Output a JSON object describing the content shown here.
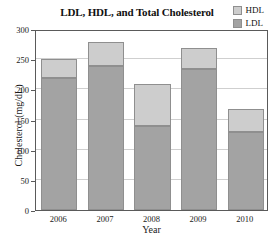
{
  "chart_data": {
    "type": "bar",
    "subtype": "stacked-bar",
    "title": "LDL, HDL, and Total Cholesterol",
    "xlabel": "Year",
    "ylabel": "Cholesterol (mg/dL)",
    "categories": [
      "2006",
      "2007",
      "2008",
      "2009",
      "2010"
    ],
    "series": [
      {
        "name": "LDL",
        "values": [
          219,
          239,
          139,
          234,
          129
        ],
        "color": "#a3a3a3"
      },
      {
        "name": "HDL",
        "values": [
          31,
          40,
          70,
          35,
          39
        ],
        "color": "#cdcdcd"
      }
    ],
    "totals": [
      250,
      279,
      209,
      269,
      168
    ],
    "ylim": [
      0,
      300
    ],
    "yticks": [
      0,
      50,
      100,
      150,
      200,
      250,
      300
    ],
    "ytick_labels": [
      "0",
      "50",
      "100",
      "150",
      "200",
      "250",
      "300"
    ],
    "grid": true,
    "grid_axis": "y",
    "legend": {
      "position": "top-right",
      "entries": [
        {
          "label": "HDL",
          "color": "#cdcdcd"
        },
        {
          "label": "LDL",
          "color": "#a3a3a3"
        }
      ]
    },
    "stack_order_bottom_to_top": [
      "LDL",
      "HDL"
    ]
  },
  "colors": {
    "ldl": "#a3a3a3",
    "hdl": "#cdcdcd",
    "axis": "#5a5a5a",
    "grid": "#cfcfcf",
    "text": "#1a1a1a",
    "background": "#ffffff"
  }
}
